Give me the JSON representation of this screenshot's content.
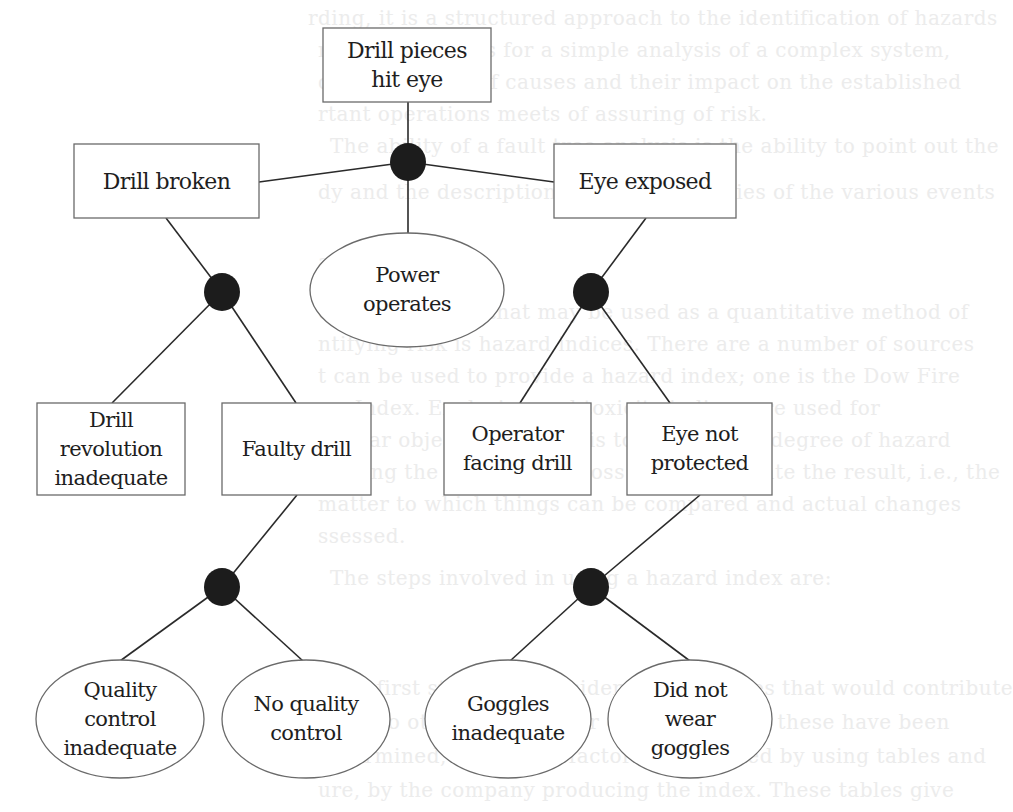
{
  "diagram": {
    "type": "fault-tree",
    "top_event": {
      "id": "top",
      "label": "Drill pieces\nhit eye",
      "shape": "rectangle"
    },
    "gates": [
      {
        "id": "g_top",
        "type": "AND",
        "output": "top",
        "inputs": [
          "drill_broken",
          "eye_exposed",
          "power_operates"
        ]
      },
      {
        "id": "g_drill_broken",
        "type": "AND",
        "output": "drill_broken",
        "inputs": [
          "drill_revolution",
          "faulty_drill"
        ]
      },
      {
        "id": "g_eye_exposed",
        "type": "AND",
        "output": "eye_exposed",
        "inputs": [
          "operator_facing",
          "eye_not_protected"
        ]
      },
      {
        "id": "g_faulty_drill",
        "type": "AND",
        "output": "faulty_drill",
        "inputs": [
          "qc_inadequate",
          "no_qc"
        ]
      },
      {
        "id": "g_eye_not_protected",
        "type": "AND",
        "output": "eye_not_protected",
        "inputs": [
          "goggles_inadequate",
          "no_goggles"
        ]
      }
    ],
    "intermediate_events": [
      {
        "id": "drill_broken",
        "label": "Drill broken",
        "shape": "rectangle"
      },
      {
        "id": "eye_exposed",
        "label": "Eye exposed",
        "shape": "rectangle"
      },
      {
        "id": "drill_revolution",
        "label": "Drill\nrevolution\ninadequate",
        "shape": "rectangle"
      },
      {
        "id": "faulty_drill",
        "label": "Faulty drill",
        "shape": "rectangle"
      },
      {
        "id": "operator_facing",
        "label": "Operator\nfacing drill",
        "shape": "rectangle"
      },
      {
        "id": "eye_not_protected",
        "label": "Eye not\nprotected",
        "shape": "rectangle"
      }
    ],
    "basic_events": [
      {
        "id": "power_operates",
        "label": "Power\noperates",
        "shape": "ellipse"
      },
      {
        "id": "qc_inadequate",
        "label": "Quality\ncontrol\ninadequate",
        "shape": "ellipse"
      },
      {
        "id": "no_qc",
        "label": "No quality\ncontrol",
        "shape": "ellipse"
      },
      {
        "id": "goggles_inadequate",
        "label": "Goggles\ninadequate",
        "shape": "ellipse"
      },
      {
        "id": "no_goggles",
        "label": "Did not\nwear\ngoggles",
        "shape": "ellipse"
      }
    ]
  },
  "colors": {
    "line": "#2a2a2a",
    "box_border": "#6a6a6a",
    "gate_fill": "#1c1c1c",
    "text": "#1e1e1e",
    "background": "#ffffff",
    "bleed_text": "#ececec"
  },
  "background_bleed_text": [
    "rding, it is a structured approach to the identification of hazards",
    "risks; it provides for a simple analysis of a complex system,",
    "d the ordering of causes and their impact on the established",
    "rtant operations meets of assuring of risk.",
    "The ability of a fault tree analysis is the ability to point out the",
    "dy and the description of the probabilities of the various events",
    "ard indices",
    "other approach that may be used as a quantitative method of",
    "ntifying risk is hazard indices. There are a number of sources",
    "t can be used to provide a hazard index; one is the Dow Fire",
    "ew Index. Explosion and toxicity indices are used for",
    "similar objectives, which is to express the degree of hazard",
    "lenging the likelihood of loss and to evaluate the result, i.e., the",
    "matter to which things can be compared and actual changes",
    "ssessed.",
    "The steps involved in using a hazard index are:",
    "The first step is to consider the processes that would contribute",
    "more to others to a loss or exposure. Once these have been",
    "determined, a material factor is calculated by using tables and",
    "ure, by the company producing the index. These tables give"
  ]
}
